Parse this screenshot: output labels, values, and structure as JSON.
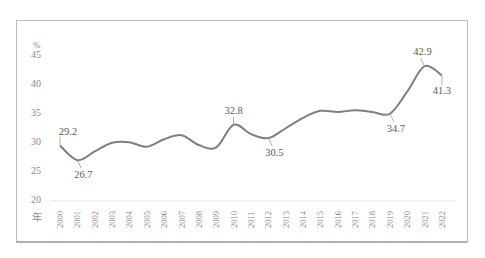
{
  "chart_data": {
    "type": "line",
    "title": "",
    "xlabel": "年",
    "ylabel": "%",
    "ylim": [
      20,
      45
    ],
    "yticks": [
      20,
      25,
      30,
      35,
      40,
      45
    ],
    "grid": false,
    "legend": null,
    "categories": [
      "2000",
      "2001",
      "2002",
      "2003",
      "2004",
      "2005",
      "2006",
      "2007",
      "2008",
      "2009",
      "2010",
      "2011",
      "2012",
      "2013",
      "2014",
      "2015",
      "2016",
      "2017",
      "2018",
      "2019",
      "2020",
      "2021",
      "2022"
    ],
    "series": [
      {
        "name": "share",
        "color": "#7f7f7f",
        "values": [
          29.2,
          26.7,
          28.2,
          29.7,
          29.8,
          29.0,
          30.3,
          31.0,
          29.3,
          28.9,
          32.8,
          31.2,
          30.5,
          32.2,
          34.0,
          35.2,
          35.0,
          35.3,
          35.0,
          34.7,
          38.5,
          42.9,
          41.3
        ]
      }
    ],
    "annotations": [
      {
        "year": "2000",
        "label": "29.2",
        "position": "above"
      },
      {
        "year": "2001",
        "label": "26.7",
        "position": "below"
      },
      {
        "year": "2010",
        "label": "32.8",
        "position": "above"
      },
      {
        "year": "2012",
        "label": "30.5",
        "position": "below"
      },
      {
        "year": "2019",
        "label": "34.7",
        "position": "below"
      },
      {
        "year": "2021",
        "label": "42.9",
        "position": "above"
      },
      {
        "year": "2022",
        "label": "41.3",
        "position": "below"
      }
    ]
  }
}
